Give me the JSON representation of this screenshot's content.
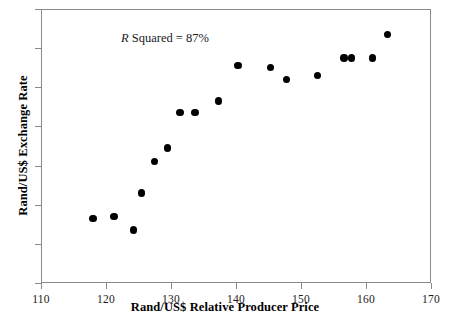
{
  "chart_data": {
    "type": "scatter",
    "title": "",
    "xlabel": "Rand/US$ Relative Producer Price",
    "ylabel": "Rand/US$ Exchange Rate",
    "xlim": [
      110,
      170
    ],
    "ylim": [
      2.5,
      3.9
    ],
    "xticks": [
      "110",
      "120",
      "130",
      "140",
      "150",
      "160",
      "170"
    ],
    "xtick_values": [
      110,
      120,
      130,
      140,
      150,
      160,
      170
    ],
    "yticks": [
      "2.5",
      "2.7",
      "2.9",
      "3.1",
      "3.3",
      "3.5",
      "3.7",
      "3.9"
    ],
    "ytick_values": [
      2.5,
      2.7,
      2.9,
      3.1,
      3.3,
      3.5,
      3.7,
      3.9
    ],
    "grid": false,
    "legend": null,
    "marker_color": "#000000",
    "marker_size": 7,
    "annotation": {
      "text_prefix": "R",
      "text_rest": " Squared = 87%",
      "full_text": "R Squared = 87%",
      "r_squared_percent": 87
    },
    "x": [
      118.0,
      121.2,
      124.2,
      125.5,
      127.5,
      129.5,
      131.4,
      133.7,
      137.3,
      140.3,
      145.3,
      147.8,
      152.5,
      156.6,
      157.8,
      161.0,
      163.3
    ],
    "y": [
      2.83,
      2.84,
      2.77,
      2.96,
      3.12,
      3.19,
      3.37,
      3.37,
      3.43,
      3.61,
      3.6,
      3.54,
      3.56,
      3.65,
      3.65,
      3.65,
      3.77
    ],
    "points": [
      {
        "x": 118.0,
        "y": 2.83
      },
      {
        "x": 121.2,
        "y": 2.84
      },
      {
        "x": 124.2,
        "y": 2.77
      },
      {
        "x": 125.5,
        "y": 2.96
      },
      {
        "x": 127.5,
        "y": 3.12
      },
      {
        "x": 129.5,
        "y": 3.19
      },
      {
        "x": 131.4,
        "y": 3.37
      },
      {
        "x": 133.7,
        "y": 3.37
      },
      {
        "x": 137.3,
        "y": 3.43
      },
      {
        "x": 140.3,
        "y": 3.61
      },
      {
        "x": 145.3,
        "y": 3.6
      },
      {
        "x": 147.8,
        "y": 3.54
      },
      {
        "x": 152.5,
        "y": 3.56
      },
      {
        "x": 156.6,
        "y": 3.65
      },
      {
        "x": 157.8,
        "y": 3.65
      },
      {
        "x": 161.0,
        "y": 3.65
      },
      {
        "x": 163.3,
        "y": 3.77
      }
    ]
  }
}
